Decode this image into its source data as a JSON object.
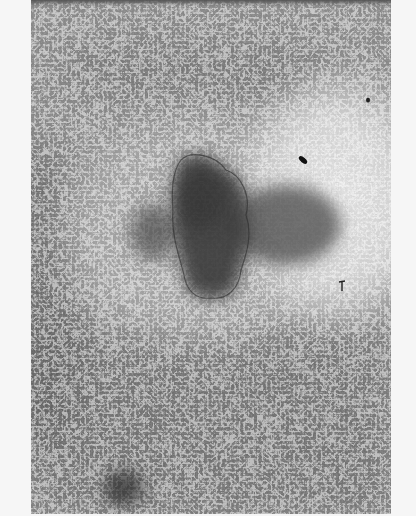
{
  "image": {
    "type": "grayscale phase-contrast micrograph",
    "description": "Dense cell monolayer surrounding a dark central tissue explant with a cleared, lighter zone of spread elongated cells to the right",
    "features": [
      {
        "name": "central-explant",
        "shade": "dark",
        "position": "center"
      },
      {
        "name": "outgrowth-halo",
        "shade": "medium-dark",
        "position": "right of explant"
      },
      {
        "name": "cleared-zone",
        "shade": "light",
        "position": "upper right"
      },
      {
        "name": "dense-monolayer",
        "shade": "medium",
        "position": "periphery"
      },
      {
        "name": "dark-spot",
        "shade": "dark",
        "position": "bottom left"
      },
      {
        "name": "debris-particle",
        "shade": "black",
        "position": "upper right"
      }
    ],
    "colors": {
      "page_background": "#f6f6f6",
      "monolayer": "#8a8a8a",
      "cleared_zone": "#d9d9d9",
      "explant": "#3a3a3a"
    }
  }
}
